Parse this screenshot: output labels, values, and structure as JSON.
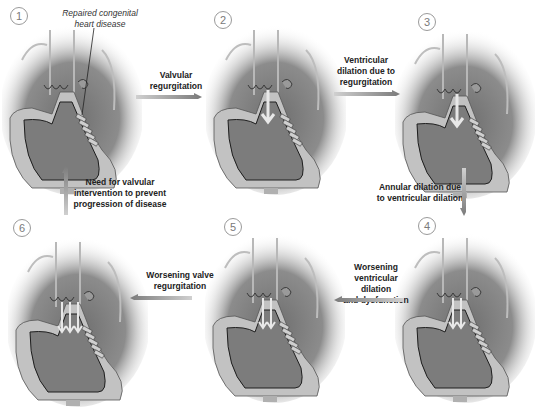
{
  "diagram": {
    "type": "cycle-flow",
    "topic": "Progression of valvular disease after repaired congenital heart disease",
    "annotation": "Repaired congenital heart disease",
    "stages": [
      {
        "id": 1,
        "number": "1"
      },
      {
        "id": 2,
        "number": "2"
      },
      {
        "id": 3,
        "number": "3"
      },
      {
        "id": 4,
        "number": "4"
      },
      {
        "id": 5,
        "number": "5"
      },
      {
        "id": 6,
        "number": "6"
      }
    ],
    "transitions": [
      {
        "from": 1,
        "to": 2,
        "line1": "Valvular",
        "line2": "regurgitation",
        "line3": ""
      },
      {
        "from": 2,
        "to": 3,
        "line1": "Ventricular",
        "line2": "dilation due to",
        "line3": "regurgitation"
      },
      {
        "from": 3,
        "to": 4,
        "line1": "Annular dilation due",
        "line2": "to ventricular dilation",
        "line3": ""
      },
      {
        "from": 4,
        "to": 5,
        "line1": "Worsening",
        "line2": "ventricular dilation",
        "line3": "and dysfunction"
      },
      {
        "from": 5,
        "to": 6,
        "line1": "Worsening valve",
        "line2": "regurgitation",
        "line3": ""
      },
      {
        "from": 6,
        "to": 1,
        "line1": "Need for valvular",
        "line2": "intervention to prevent",
        "line3": "progression of disease"
      }
    ],
    "colors": {
      "background": "#ffffff",
      "heart_fill": "#8f8f8f",
      "ventricle_fill": "#7a7a7a",
      "wall_light": "#bdbdbd",
      "outline": "#2a2a2a",
      "arrow": "#8a8a8a",
      "text": "#222222"
    }
  }
}
